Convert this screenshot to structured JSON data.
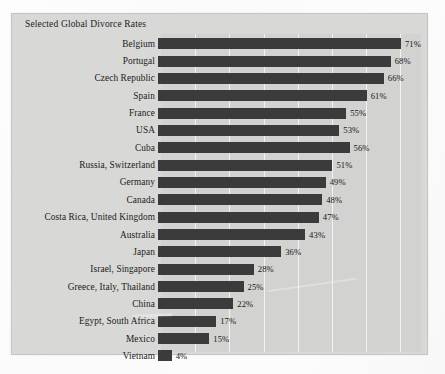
{
  "chart_data": {
    "type": "bar",
    "orientation": "horizontal",
    "title": "Selected Global Divorce Rates",
    "xlabel": "",
    "ylabel": "",
    "xlim": [
      0,
      76
    ],
    "grid": true,
    "gridline_interval": 10,
    "legend": "none",
    "value_suffix": "%",
    "categories": [
      "Belgium",
      "Portugal",
      "Czech Republic",
      "Spain",
      "France",
      "USA",
      "Cuba",
      "Russia, Switzerland",
      "Germany",
      "Canada",
      "Costa Rica, United Kingdom",
      "Australia",
      "Japan",
      "Israel, Singapore",
      "Greece, Italy, Thailand",
      "China",
      "Egypt, South Africa",
      "Mexico",
      "Vietnam"
    ],
    "values": [
      71,
      68,
      66,
      61,
      55,
      53,
      56,
      51,
      49,
      48,
      47,
      43,
      36,
      28,
      25,
      22,
      17,
      15,
      4
    ],
    "value_labels": [
      "71%",
      "68%",
      "66%",
      "61%",
      "55%",
      "53%",
      "56%",
      "51%",
      "49%",
      "48%",
      "47%",
      "43%",
      "36%",
      "28%",
      "25%",
      "22%",
      "17%",
      "15%",
      "4%"
    ],
    "bar_color": "#3b3b3b",
    "plot_background": "#d2d2d0",
    "card_background": "#d8d8d6",
    "gridline_color": "#f2f2f0"
  }
}
